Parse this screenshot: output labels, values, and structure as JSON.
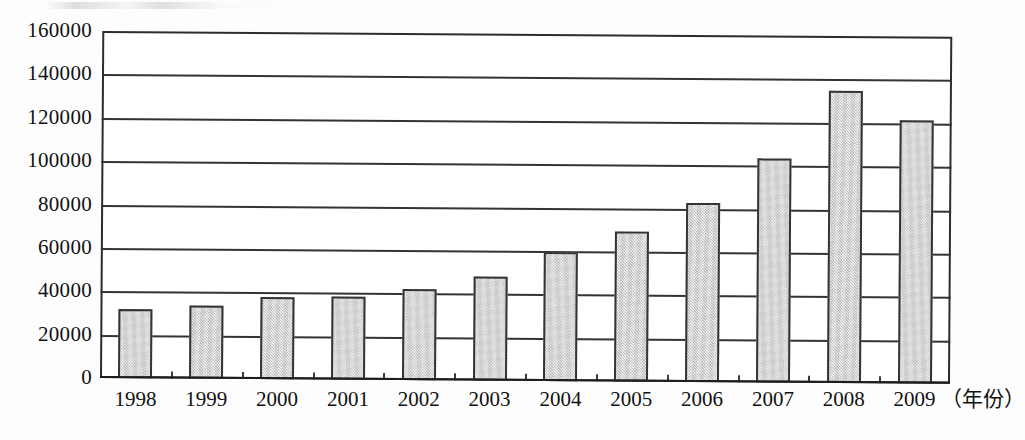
{
  "chart_data": {
    "type": "bar",
    "title": "",
    "xlabel": "（年份）",
    "ylabel": "",
    "categories": [
      "1998",
      "1999",
      "2000",
      "2001",
      "2002",
      "2003",
      "2004",
      "2005",
      "2006",
      "2007",
      "2008",
      "2009"
    ],
    "values": [
      32000,
      33500,
      37800,
      38500,
      42000,
      48000,
      59500,
      69000,
      82500,
      103500,
      134500,
      121500
    ],
    "ylim": [
      0,
      160000
    ],
    "ytick_labels": [
      "0",
      "20000",
      "40000",
      "60000",
      "80000",
      "100000",
      "120000",
      "140000",
      "160000"
    ],
    "ytick_values": [
      0,
      20000,
      40000,
      60000,
      80000,
      100000,
      120000,
      140000,
      160000
    ],
    "grid": true,
    "legend": "none",
    "bar_fill_color": "#c9c9c9",
    "bar_border_color": "#343434",
    "axis_color": "#2c2c2c",
    "background_color": "#ffffff"
  }
}
